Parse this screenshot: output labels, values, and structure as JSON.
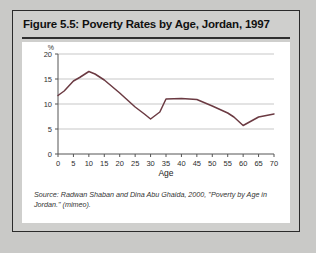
{
  "figure": {
    "title": "Figure 5.5: Poverty Rates by Age, Jordan, 1997",
    "source": "Source: Radwan Shaban and Dina Abu Ghaida, 2000, \"Poverty by Age in Jordan.\" (mimeo)."
  },
  "chart_data": {
    "type": "line",
    "title": "",
    "xlabel": "Age",
    "ylabel": "",
    "yunit": "%",
    "x": [
      0,
      2,
      5,
      7,
      10,
      12,
      15,
      20,
      25,
      28,
      30,
      33,
      35,
      40,
      45,
      50,
      55,
      57,
      60,
      65,
      70
    ],
    "values": [
      11.7,
      12.6,
      14.6,
      15.3,
      16.5,
      16.0,
      14.8,
      12.2,
      9.4,
      8.0,
      7.0,
      8.4,
      11.0,
      11.1,
      10.9,
      9.6,
      8.2,
      7.4,
      5.7,
      7.4,
      8.0
    ],
    "series": [
      {
        "name": "Poverty rate",
        "color": "#6b3a42",
        "values": [
          11.7,
          12.6,
          14.6,
          15.3,
          16.5,
          16.0,
          14.8,
          12.2,
          9.4,
          8.0,
          7.0,
          8.4,
          11.0,
          11.1,
          10.9,
          9.6,
          8.2,
          7.4,
          5.7,
          7.4,
          8.0
        ]
      }
    ],
    "xticks": [
      0,
      5,
      10,
      15,
      20,
      25,
      30,
      35,
      40,
      45,
      50,
      55,
      60,
      65,
      70
    ],
    "yticks": [
      0,
      5,
      10,
      15,
      20
    ],
    "xlim": [
      0,
      70
    ],
    "ylim": [
      0,
      20
    ],
    "grid": "horizontal",
    "legend": "none"
  },
  "colors": {
    "line": "#6b3a42",
    "grid": "#b9b9b9",
    "axis": "#555555",
    "panel_bg": "#ffffff",
    "card_bg": "#cfcfcd",
    "page_bg": "#c9c9c7",
    "border": "#2b2b2b"
  }
}
